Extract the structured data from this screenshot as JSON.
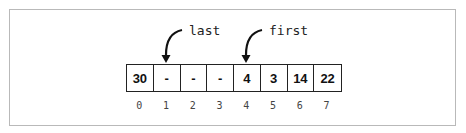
{
  "diagram": {
    "cells": [
      "30",
      "-",
      "-",
      "-",
      "4",
      "3",
      "14",
      "22"
    ],
    "indices": [
      "0",
      "1",
      "2",
      "3",
      "4",
      "5",
      "6",
      "7"
    ],
    "pointers": [
      {
        "label": "last",
        "index": 1
      },
      {
        "label": "first",
        "index": 4
      }
    ]
  }
}
